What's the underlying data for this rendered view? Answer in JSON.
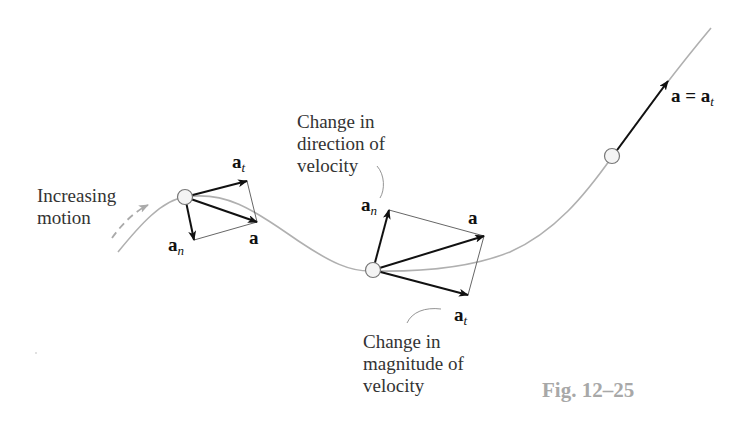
{
  "figure": {
    "caption": "Fig. 12–25",
    "type": "kinematics diagram: tangential and normal components of acceleration along a curved path",
    "colors": {
      "path": "#b0b0b0",
      "vector": "#111111",
      "parallelogram": "#555555",
      "caption": "#a8a8a8",
      "text": "#333333"
    }
  },
  "labels": {
    "increasing_motion": [
      "Increasing",
      "motion"
    ],
    "change_direction": [
      "Change in",
      "direction of",
      "velocity"
    ],
    "change_magnitude": [
      "Change in",
      "magnitude of",
      "velocity"
    ]
  },
  "vectors": {
    "p1": {
      "at_main": "a",
      "at_sub": "t",
      "an_main": "a",
      "an_sub": "n",
      "a": "a"
    },
    "p2": {
      "an_main": "a",
      "an_sub": "n",
      "a": "a",
      "at_main": "a",
      "at_sub": "t"
    },
    "p3": {
      "eq_left": "a = a",
      "eq_sub": "t"
    }
  }
}
